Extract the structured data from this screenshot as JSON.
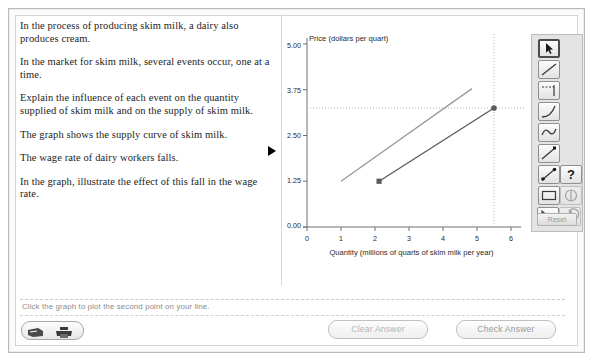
{
  "question": {
    "paragraphs": [
      "In the process of producing skim milk, a dairy also produces cream.",
      "In the market for skim milk, several events occur, one at a time.",
      "Explain the influence of each event on the quantity supplied of skim milk and on the supply of skim milk.",
      "The graph shows the supply curve of skim milk.",
      "The wage rate of dairy workers falls.",
      "In the graph, illustrate the effect of this fall in the wage rate."
    ]
  },
  "chart_data": {
    "type": "line",
    "title": "Price (dollars per quart)",
    "xlabel": "Quantity (millions of quarts of skim milk per year)",
    "ylabel": "Price (dollars per quart)",
    "xlim": [
      0,
      6
    ],
    "ylim": [
      0.0,
      5.0
    ],
    "xticks": [
      "0",
      "1",
      "2",
      "3",
      "4",
      "5",
      "6"
    ],
    "yticks": [
      "0.00",
      "1.25",
      "2.50",
      "3.75",
      "5.00"
    ],
    "grid": false,
    "legend": "none",
    "series": [
      {
        "name": "original-supply-curve",
        "color": "#9a9a9a",
        "x": [
          1.0,
          4.85
        ],
        "y": [
          1.25,
          3.78
        ],
        "markers": []
      },
      {
        "name": "user-drawn-line",
        "color": "#5a5a5a",
        "x": [
          2.12,
          5.5
        ],
        "y": [
          1.25,
          3.25
        ],
        "markers": [
          {
            "shape": "square",
            "x": 2.12,
            "y": 1.25
          },
          {
            "shape": "circle",
            "x": 5.5,
            "y": 3.25
          }
        ]
      }
    ],
    "guides": [
      {
        "type": "hline",
        "y": 3.25,
        "style": "dotted"
      },
      {
        "type": "vline",
        "x": 5.5,
        "style": "dotted"
      }
    ],
    "annotations": [
      {
        "name": "row-pointer",
        "text": "",
        "at_y": 2.5
      }
    ]
  },
  "toolbar": {
    "reset_label": "Reset",
    "tools": [
      {
        "id": "select",
        "name": "pointer-tool",
        "selected": true
      },
      {
        "id": "line",
        "name": "straight-line-tool",
        "selected": false
      },
      {
        "id": "line-segment",
        "name": "line-segment-tool",
        "selected": false
      },
      {
        "id": "curve",
        "name": "curve-tool",
        "selected": false
      },
      {
        "id": "squiggle",
        "name": "freehand-curve-tool",
        "selected": false
      },
      {
        "id": "ray",
        "name": "ray-tool",
        "selected": false
      },
      {
        "id": "arrow",
        "name": "arrow-tool",
        "selected": false
      },
      {
        "id": "rectangle",
        "name": "rectangle-tool",
        "selected": false
      },
      {
        "id": "triangle",
        "name": "triangle-tool",
        "selected": false
      },
      {
        "id": "help",
        "name": "help-tool",
        "selected": false
      },
      {
        "id": "shade",
        "name": "shading-tool",
        "selected": false
      },
      {
        "id": "undo",
        "name": "undo-tool",
        "selected": false
      }
    ]
  },
  "status": {
    "message": "Click the graph to plot the second point on your line."
  },
  "footer": {
    "clear_label": "Clear Answer",
    "check_label": "Check Answer",
    "icons": [
      {
        "id": "notes",
        "name": "notes-icon"
      },
      {
        "id": "print",
        "name": "print-icon"
      }
    ]
  },
  "colors": {
    "original_curve": "#9a9a9a",
    "user_curve": "#5a5a5a",
    "axis": "#6f6f6f",
    "guide": "#b5b5b5",
    "frame": "#b9b9b9"
  }
}
